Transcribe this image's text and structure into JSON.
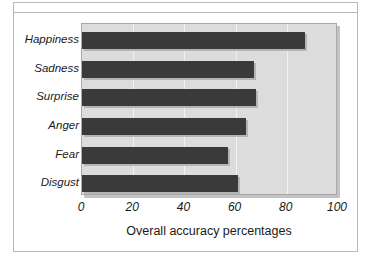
{
  "chart_data": {
    "type": "bar",
    "orientation": "horizontal",
    "title": "",
    "xlabel": "Overall accuracy percentages",
    "ylabel": "",
    "categories": [
      "Happiness",
      "Sadness",
      "Surprise",
      "Anger",
      "Fear",
      "Disgust"
    ],
    "values": [
      87,
      67,
      68,
      64,
      57,
      61
    ],
    "xlim": [
      0,
      100
    ],
    "xticks": [
      0,
      20,
      40,
      60,
      80,
      100
    ],
    "xtick_labels": [
      "0",
      "20",
      "40",
      "60",
      "80",
      "100"
    ],
    "grid": "vertical-white-gridlines",
    "legend": "none",
    "colors": {
      "bar": "#3a3a3a",
      "plot_background": "#dcdcdc",
      "gridline": "#f2f2f2",
      "figure_background": "#ffffff",
      "frame_border": "#b9b9b9",
      "text": "#1a1a1a"
    }
  }
}
